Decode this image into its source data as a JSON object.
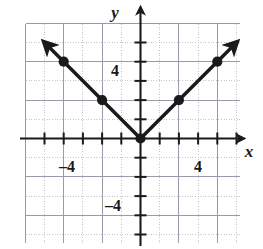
{
  "figure": {
    "kind": "coordinate-plane-graph",
    "background_color": "#ffffff",
    "ink_color": "#1a1a1a",
    "grid_minor_color": "#b9b9c6",
    "grid_major_color": "#9a9aa8"
  },
  "labels": {
    "x_axis": "x",
    "y_axis": "y",
    "x_negative_tick": "–4",
    "x_positive_tick": "4",
    "y_positive_tick": "4",
    "y_negative_tick": "–4"
  },
  "chart_data": {
    "type": "line",
    "title": "",
    "xlabel": "x",
    "ylabel": "y",
    "xlim": [
      -5.5,
      5.5
    ],
    "ylim": [
      -5.5,
      5.5
    ],
    "grid": true,
    "legend": "none",
    "xticks": [
      -5,
      -4,
      -3,
      -2,
      -1,
      0,
      1,
      2,
      3,
      4,
      5
    ],
    "yticks": [
      -5,
      -4,
      -3,
      -2,
      -1,
      0,
      1,
      2,
      3,
      4,
      5
    ],
    "xtick_labels": [
      "",
      "–4",
      "",
      "",
      "",
      "",
      "",
      "",
      "",
      "4",
      ""
    ],
    "ytick_labels": [
      "",
      "–4",
      "",
      "",
      "",
      "",
      "",
      "",
      "",
      "4",
      ""
    ],
    "series": [
      {
        "name": "y = |x|",
        "equation": "y = |x|",
        "shape": "V",
        "arrows": [
          "start",
          "end"
        ],
        "x": [
          -5,
          0,
          5
        ],
        "values": [
          5,
          0,
          5
        ]
      }
    ],
    "marked_points": [
      {
        "x": -4,
        "y": 4
      },
      {
        "x": -2,
        "y": 2
      },
      {
        "x": 0,
        "y": 0
      },
      {
        "x": 2,
        "y": 2
      },
      {
        "x": 4,
        "y": 4
      }
    ],
    "vertex": {
      "x": 0,
      "y": 0
    }
  }
}
